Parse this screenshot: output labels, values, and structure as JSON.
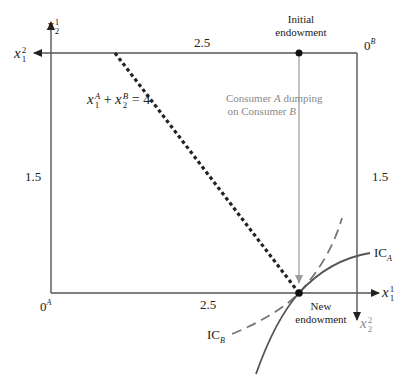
{
  "diagram": {
    "type": "edgeworth_box",
    "axes": {
      "consumer_a_vertical": {
        "var": "x",
        "top": "1",
        "bottom": "2"
      },
      "consumer_b_horizontal": {
        "var": "x",
        "top": "2",
        "bottom": "1"
      },
      "consumer_a_horizontal": {
        "var": "x",
        "top": "1",
        "bottom": "1"
      },
      "consumer_b_vertical": {
        "var": "x",
        "top": "2",
        "bottom": "2"
      }
    },
    "origins": {
      "a": {
        "base": "0",
        "sup": "A"
      },
      "b": {
        "base": "0",
        "sup": "B"
      }
    },
    "tick_labels": {
      "top": "2.5",
      "bottom": "2.5",
      "left": "1.5",
      "right": "1.5"
    },
    "points": {
      "initial": {
        "line1": "Initial",
        "line2": "endowment"
      },
      "new": {
        "line1": "New",
        "line2": "endowment"
      }
    },
    "annotation": {
      "line1_pre": "Consumer ",
      "line1_em": "A",
      "line1_post": " dumping",
      "line2_pre": "on Consumer ",
      "line2_em": "B"
    },
    "budget_line": {
      "x": "x",
      "a_sub": "1",
      "a_sup": "A",
      "plus": " + ",
      "b_sub": "2",
      "b_sup": "B",
      "rhs": " = 4"
    },
    "curves": {
      "ic_a": {
        "base": "IC",
        "sub": "A"
      },
      "ic_b": {
        "base": "IC",
        "sub": "B"
      }
    },
    "colors": {
      "ink": "#222222",
      "gray": "#8a8a8a",
      "ic": "#555555"
    }
  }
}
